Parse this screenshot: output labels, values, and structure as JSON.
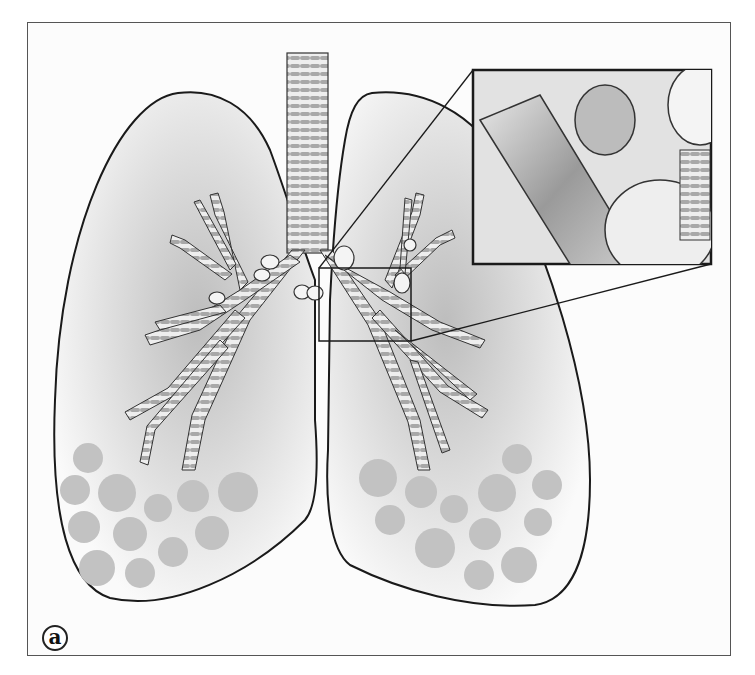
{
  "figure": {
    "panel_label": "a",
    "inset": {
      "subject": "Magnified view of bronchiole lumen with cells and alveolar sac",
      "source_region": "left main bronchus of the left lung (viewer's right)"
    },
    "colors": {
      "outline": "#1a1a1a",
      "cartilage_gray": "#a8a8a8",
      "lumen_gray": "#d6d6d6",
      "shading": "#c8c8c8",
      "background": "#fcfcfc"
    },
    "alveoli_clusters": {
      "left_lung_count": 13,
      "right_lung_count": 13
    }
  }
}
